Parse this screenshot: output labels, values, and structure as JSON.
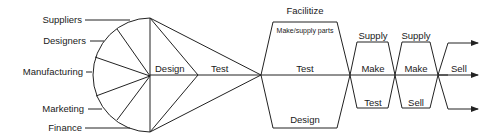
{
  "diagram": {
    "stakeholders": [
      {
        "label": "Suppliers"
      },
      {
        "label": "Designers"
      },
      {
        "label": "Manufacturing"
      },
      {
        "label": "Marketing"
      },
      {
        "label": "Finance"
      }
    ],
    "funnel": {
      "design_label": "Design",
      "test_label": "Test"
    },
    "stage1": {
      "title": "Facilitize",
      "top_label": "Make/supply parts",
      "middle_label": "Test",
      "bottom_label": "Design"
    },
    "stage2": {
      "top_label": "Supply",
      "middle_label": "Make",
      "bottom_label": "Test"
    },
    "stage3": {
      "top_label": "Supply",
      "middle_label": "Make",
      "bottom_label": "Sell"
    },
    "output": {
      "middle_label": "Sell",
      "arrow_count": 3
    },
    "colors": {
      "line": "#222222",
      "text": "#1a1a1a",
      "background": "#ffffff"
    }
  }
}
